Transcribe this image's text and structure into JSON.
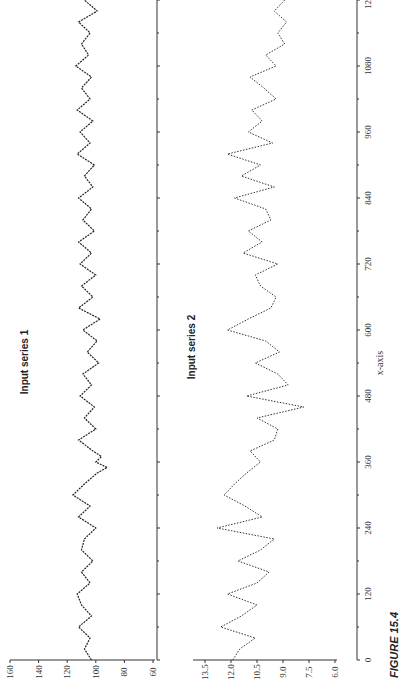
{
  "figure": {
    "caption_label": "FIGURE 15.4",
    "orientation": "rotated 90 degrees counter-clockwise"
  },
  "chart_data": [
    {
      "type": "line",
      "title": "Input series 1",
      "xlabel": "x-axis",
      "ylabel": "y-axis x 10³",
      "xlim": [
        0,
        1200
      ],
      "ylim": [
        60,
        160
      ],
      "xticks": [
        0,
        120,
        240,
        360,
        480,
        600,
        720,
        840,
        960,
        1080,
        1200
      ],
      "yticks": [
        60,
        80,
        100,
        120,
        140,
        160
      ],
      "grid": false,
      "x": [
        0,
        20,
        40,
        60,
        80,
        100,
        120,
        140,
        160,
        180,
        200,
        220,
        240,
        260,
        280,
        300,
        320,
        340,
        350,
        360,
        370,
        380,
        400,
        420,
        440,
        460,
        480,
        500,
        520,
        540,
        560,
        580,
        600,
        620,
        640,
        660,
        680,
        700,
        720,
        740,
        760,
        780,
        800,
        820,
        840,
        860,
        880,
        900,
        920,
        940,
        960,
        980,
        1000,
        1020,
        1040,
        1060,
        1080,
        1100,
        1120,
        1140,
        1160,
        1180,
        1200
      ],
      "values": [
        103,
        108,
        104,
        112,
        103,
        110,
        113,
        104,
        110,
        102,
        110,
        108,
        100,
        112,
        104,
        116,
        108,
        99,
        92,
        100,
        96,
        102,
        112,
        100,
        108,
        101,
        111,
        103,
        109,
        98,
        106,
        99,
        109,
        97,
        112,
        102,
        110,
        100,
        111,
        103,
        112,
        101,
        109,
        103,
        112,
        102,
        108,
        101,
        113,
        104,
        111,
        102,
        113,
        104,
        110,
        103,
        114,
        105,
        110,
        104,
        112,
        99,
        108
      ]
    },
    {
      "type": "line",
      "title": "Input series 2",
      "xlabel": "x-axis",
      "ylabel": "y-axis",
      "xlim": [
        0,
        1200
      ],
      "ylim": [
        6.0,
        13.5
      ],
      "xticks": [
        0,
        120,
        240,
        360,
        480,
        600,
        720,
        840,
        960,
        1080,
        1200
      ],
      "yticks": [
        6.0,
        7.5,
        9.0,
        10.5,
        12.0,
        13.5
      ],
      "grid": false,
      "x": [
        0,
        20,
        40,
        60,
        80,
        100,
        120,
        140,
        160,
        180,
        200,
        220,
        240,
        260,
        280,
        300,
        320,
        340,
        360,
        380,
        400,
        420,
        440,
        460,
        480,
        500,
        520,
        540,
        560,
        580,
        600,
        620,
        640,
        660,
        680,
        700,
        720,
        740,
        760,
        780,
        800,
        820,
        840,
        860,
        880,
        900,
        920,
        940,
        960,
        980,
        1000,
        1020,
        1040,
        1060,
        1080,
        1100,
        1120,
        1140,
        1160,
        1180,
        1200
      ],
      "values": [
        11.9,
        11.5,
        10.6,
        12.6,
        11.4,
        10.5,
        12.2,
        10.5,
        9.8,
        11.6,
        10.3,
        9.5,
        12.8,
        10.2,
        11.2,
        12.4,
        11.8,
        11.1,
        10.3,
        10.9,
        9.5,
        9.3,
        10.5,
        7.8,
        11.1,
        8.7,
        9.3,
        10.6,
        9.2,
        10.0,
        12.2,
        11.0,
        9.7,
        9.4,
        10.3,
        10.6,
        9.3,
        11.3,
        10.2,
        11.0,
        9.7,
        10.0,
        11.8,
        9.5,
        11.4,
        10.3,
        12.2,
        9.6,
        11.0,
        10.2,
        10.8,
        9.4,
        10.1,
        10.9,
        9.4,
        10.0,
        8.9,
        9.3,
        8.8,
        9.5,
        8.9
      ]
    }
  ]
}
